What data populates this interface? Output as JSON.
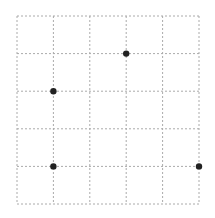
{
  "grid": {
    "columns": 5,
    "rows": 5,
    "origin_px": [
      17,
      16
    ],
    "cell_width_px": 36.4,
    "cell_height_px": 37.6,
    "line_color": "#aaaaaa",
    "line_style": "dashed"
  },
  "points": [
    {
      "col": 1,
      "row": 2,
      "color": "#222222"
    },
    {
      "col": 3,
      "row": 1,
      "color": "#222222"
    },
    {
      "col": 1,
      "row": 4,
      "color": "#222222"
    },
    {
      "col": 5,
      "row": 4,
      "color": "#222222"
    }
  ]
}
